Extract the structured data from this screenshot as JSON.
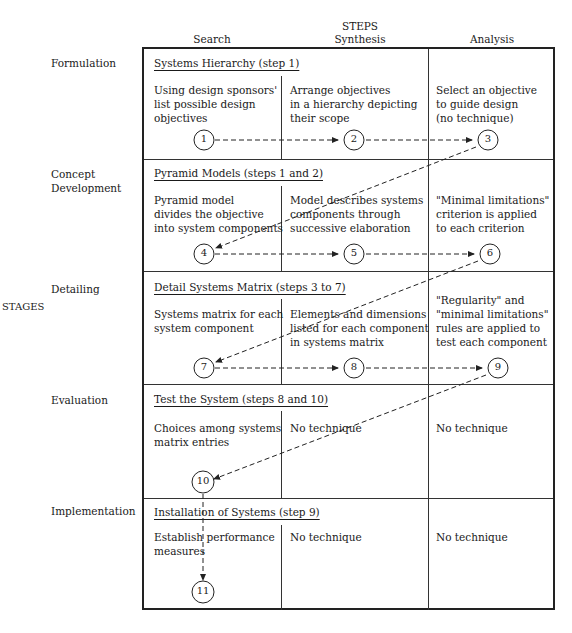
{
  "header": {
    "steps_label": "STEPS",
    "columns": [
      "Search",
      "Synthesis",
      "Analysis"
    ]
  },
  "stages_label": "STAGES",
  "rows": [
    {
      "stage": "Formulation",
      "title": "Systems Hierarchy  (step 1)",
      "cells": [
        "Using design sponsors'\nlist possible design\nobjectives",
        "Arrange objectives\nin a hierarchy depicting\ntheir scope",
        "Select an objective\nto guide design\n(no technique)"
      ],
      "nodes": [
        "1",
        "2",
        "3"
      ]
    },
    {
      "stage": "Concept\nDevelopment",
      "title": "Pyramid Models  (steps 1 and 2)",
      "cells": [
        "Pyramid model\ndivides the objective\ninto system components",
        "Model describes systems\ncomponents through\nsuccessive elaboration",
        "\"Minimal limitations\"\ncriterion is applied\nto each criterion"
      ],
      "nodes": [
        "4",
        "5",
        "6"
      ]
    },
    {
      "stage": "Detailing",
      "title": "Detail Systems Matrix  (steps 3 to 7)",
      "cells": [
        "Systems matrix for each\nsystem component",
        "Elements and dimensions\nlisted for each component\nin systems matrix",
        "\"Regularity\" and\n\"minimal limitations\"\nrules are applied to\ntest each component"
      ],
      "nodes": [
        "7",
        "8",
        "9"
      ]
    },
    {
      "stage": "Evaluation",
      "title": "Test the System  (steps 8 and 10)",
      "cells": [
        "Choices among systems\nmatrix entries",
        "No technique",
        "No technique"
      ],
      "nodes": [
        "10"
      ]
    },
    {
      "stage": "Implementation",
      "title": "Installation of Systems  (step 9)",
      "cells": [
        "Establish performance\nmeasures",
        "No technique",
        "No technique"
      ],
      "nodes": [
        "11"
      ]
    }
  ]
}
